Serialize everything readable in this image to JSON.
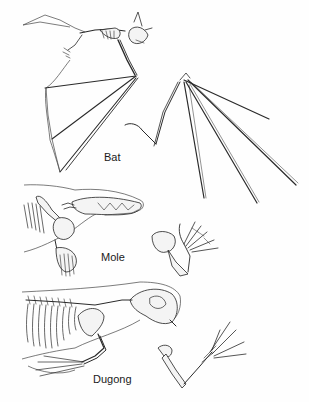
{
  "figure": {
    "panels": [
      {
        "id": "bat",
        "label": "Bat",
        "label_x": 104,
        "label_y": 157
      },
      {
        "id": "mole",
        "label": "Mole",
        "label_x": 101,
        "label_y": 256
      },
      {
        "id": "dugong",
        "label": "Dugong",
        "label_x": 93,
        "label_y": 375
      }
    ],
    "colors": {
      "line": "#2a2a2a",
      "background": "#fefefe"
    }
  }
}
